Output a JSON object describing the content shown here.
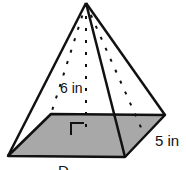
{
  "figure": {
    "shape": "square pyramid",
    "labels": {
      "height": "6 in",
      "side": "5 in",
      "bottom": "D"
    },
    "colors": {
      "base_fill": "#a8a8a8",
      "stroke": "#111111",
      "background": "#ffffff"
    }
  }
}
